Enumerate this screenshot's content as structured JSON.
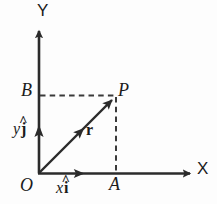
{
  "figure": {
    "kind": "vector-resolution-diagram",
    "width": 217,
    "height": 204,
    "background_color": "#fdfdfd",
    "stroke_color": "#2b2b2b",
    "dashed_color": "#3a3a3a",
    "text_color": "#1b1b1b"
  },
  "axes": {
    "x_label": "X",
    "y_label": "Y",
    "origin_label": "O",
    "x_axis": {
      "from": [
        39,
        173
      ],
      "to": [
        195,
        173
      ],
      "arrow": true
    },
    "y_axis": {
      "from": [
        39,
        173
      ],
      "to": [
        39,
        26
      ],
      "arrow": true
    }
  },
  "points": {
    "origin": {
      "label": "O",
      "coords": [
        39,
        173
      ]
    },
    "P": {
      "label": "P",
      "coords": [
        116,
        96
      ]
    },
    "A": {
      "label": "A",
      "coords": [
        116,
        173
      ]
    },
    "B": {
      "label": "B",
      "coords": [
        39,
        96
      ]
    }
  },
  "vectors": {
    "resultant": {
      "label": "r",
      "style": "bold-italic-vector",
      "from": [
        39,
        173
      ],
      "to": [
        116,
        96
      ],
      "mid_arrow": true
    },
    "x_component": {
      "scalar": "x",
      "unit": "i",
      "accent": "hat",
      "label_text": "x i",
      "from": [
        39,
        173
      ],
      "to": [
        85,
        173
      ]
    },
    "y_component": {
      "scalar": "y",
      "unit": "j",
      "accent": "hat",
      "label_text": "y j",
      "from": [
        39,
        173
      ],
      "to": [
        39,
        124
      ]
    }
  },
  "construction_lines": [
    {
      "name": "dashed-horizontal-B-to-P",
      "from": [
        40,
        95
      ],
      "to": [
        115,
        95
      ],
      "style": "dashed"
    },
    {
      "name": "dashed-vertical-P-to-A",
      "from": [
        116,
        97
      ],
      "to": [
        116,
        172
      ],
      "style": "dashed"
    }
  ],
  "glyphs": {
    "hat": "^"
  }
}
